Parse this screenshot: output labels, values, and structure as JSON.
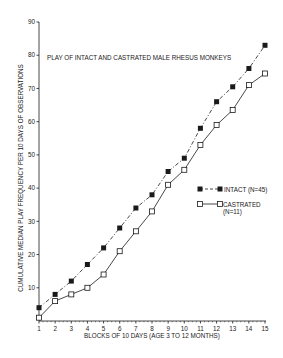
{
  "chart_data": {
    "type": "line",
    "title": "PLAY OF INTACT AND CASTRATED MALE RHESUS MONKEYS",
    "xlabel": "BLOCKS OF 10 DAYS (AGE 3 TO 12 MONTHS)",
    "ylabel": "CUMULATIVE MEDIAN PLAY FREQUENCY PER 10 DAYS OF OBSERVATIONS",
    "x": [
      1,
      2,
      3,
      4,
      5,
      6,
      7,
      8,
      9,
      10,
      11,
      12,
      13,
      14,
      15
    ],
    "x_ticks": [
      "1",
      "2",
      "3",
      "4",
      "5",
      "6",
      "7",
      "8",
      "9",
      "10",
      "11",
      "12",
      "13",
      "14",
      "15"
    ],
    "y_ticks": [
      "10",
      "20",
      "30",
      "40",
      "50",
      "60",
      "70",
      "80",
      "90"
    ],
    "ylim": [
      0,
      90
    ],
    "xlim": [
      1,
      15
    ],
    "grid": false,
    "legend_position": "right-middle",
    "series": [
      {
        "name": "INTACT (N=45)",
        "marker": "filled-square",
        "line": "dashed",
        "values": [
          4,
          8,
          12,
          17,
          22,
          28,
          34,
          38,
          45,
          49,
          58,
          66,
          70.5,
          76,
          83
        ]
      },
      {
        "name": "CASTRATED (N=11)",
        "marker": "open-square",
        "line": "solid",
        "values": [
          1,
          6,
          8,
          10,
          14,
          21,
          27,
          33,
          41,
          45.5,
          53,
          59,
          63.5,
          71,
          74.5
        ]
      }
    ]
  },
  "legend": {
    "intact_label": "INTACT (N=45)",
    "castrated_label": "CASTRATED",
    "castrated_n": "(N=11)"
  },
  "colors": {
    "ink": "#1a1a1a",
    "background": "#ffffff"
  }
}
